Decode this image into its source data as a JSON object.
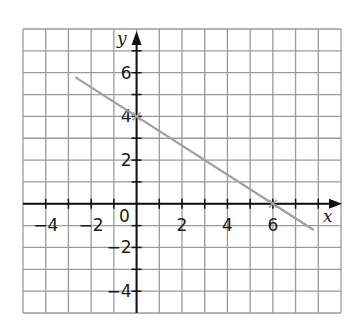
{
  "chart_data": {
    "type": "line",
    "title": "",
    "xlabel": "x",
    "ylabel": "y",
    "xlim": [
      -5,
      9
    ],
    "ylim": [
      -5,
      8
    ],
    "grid": true,
    "grid_step": 1,
    "x_ticks": [
      -4,
      -2,
      2,
      4,
      6
    ],
    "y_ticks": [
      -4,
      -2,
      2,
      4,
      6
    ],
    "x_tick_labels": [
      "−4",
      "−2",
      "2",
      "4",
      "6"
    ],
    "y_tick_labels": [
      "−4",
      "−2",
      "2",
      "4",
      "6"
    ],
    "origin_label": "0",
    "series": [
      {
        "name": "line",
        "equation": "y = -2/3 x + 4",
        "x": [
          -2.7,
          7.8
        ],
        "y": [
          5.8,
          -1.2
        ],
        "marked_points": [
          [
            0,
            4
          ],
          [
            6,
            0
          ]
        ],
        "color": "#a0a0a0"
      }
    ],
    "colors": {
      "grid": "#9a9a9a",
      "axes": "#111111",
      "line": "#a0a0a0"
    }
  }
}
